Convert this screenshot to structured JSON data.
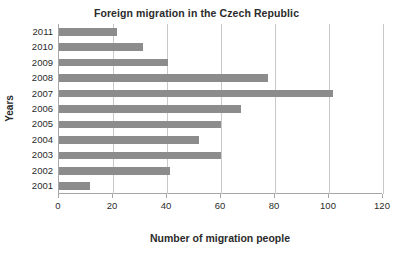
{
  "chart_data": {
    "type": "bar",
    "orientation": "horizontal",
    "title": "Foreign migration in the Czech Republic",
    "xlabel": "Number of migration people",
    "ylabel": "Years",
    "categories": [
      "2011",
      "2010",
      "2009",
      "2008",
      "2007",
      "2006",
      "2005",
      "2004",
      "2003",
      "2002",
      "2001"
    ],
    "values": [
      21.5,
      31,
      40.5,
      77.5,
      101.5,
      67.5,
      60,
      52,
      60,
      41,
      11.5
    ],
    "xlim": [
      0,
      120
    ],
    "xticks": [
      "0",
      "20",
      "40",
      "60",
      "80",
      "100",
      "120"
    ],
    "xtick_values": [
      0,
      20,
      40,
      60,
      80,
      100,
      120
    ],
    "grid": "vertical",
    "legend": "none",
    "bar_color": "#8c8c8c",
    "grid_color": "#c9c9c9",
    "axis_color": "#a6a6a6",
    "text_color": "#2b2b2b"
  }
}
